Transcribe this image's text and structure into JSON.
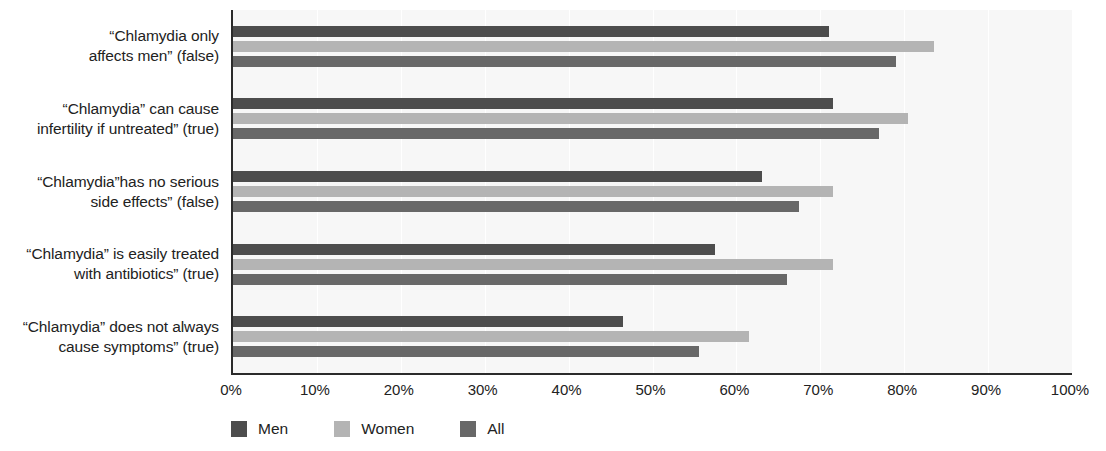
{
  "chart_data": {
    "type": "bar",
    "orientation": "horizontal",
    "title": "",
    "xlabel": "",
    "ylabel": "",
    "xlim": [
      0,
      100
    ],
    "xtick_labels": [
      "0%",
      "10%",
      "20%",
      "30%",
      "40%",
      "50%",
      "60%",
      "70%",
      "80%",
      "90%",
      "100%"
    ],
    "xtick_values": [
      0,
      10,
      20,
      30,
      40,
      50,
      60,
      70,
      80,
      90,
      100
    ],
    "grid": true,
    "legend_position": "bottom-left",
    "categories": [
      "“Chlamydia only affects men” (false)",
      "“Chlamydia” can cause infertility if untreated” (true)",
      "“Chlamydia”has no serious side effects” (false)",
      "“Chlamydia” is easily treated with antibiotics” (true)",
      "“Chlamydia” does not always cause symptoms” (true)"
    ],
    "category_lines": [
      [
        "“Chlamydia only",
        "affects men” (false)"
      ],
      [
        "“Chlamydia” can cause",
        "infertility if untreated” (true)"
      ],
      [
        "“Chlamydia”has no serious",
        "side effects” (false)"
      ],
      [
        "“Chlamydia” is easily treated",
        "with antibiotics” (true)"
      ],
      [
        "“Chlamydia” does not always",
        "cause symptoms” (true)"
      ]
    ],
    "series": [
      {
        "name": "Men",
        "color": "#4d4d4d",
        "values": [
          71,
          71.5,
          63,
          57.5,
          46.5
        ]
      },
      {
        "name": "Women",
        "color": "#b4b4b4",
        "values": [
          83.5,
          80.5,
          71.5,
          71.5,
          61.5
        ]
      },
      {
        "name": "All",
        "color": "#686868",
        "values": [
          79,
          77,
          67.5,
          66,
          55.5
        ]
      }
    ]
  },
  "legend": {
    "items": [
      {
        "label": "Men",
        "color": "#4d4d4d"
      },
      {
        "label": "Women",
        "color": "#b4b4b4"
      },
      {
        "label": "All",
        "color": "#686868"
      }
    ]
  }
}
